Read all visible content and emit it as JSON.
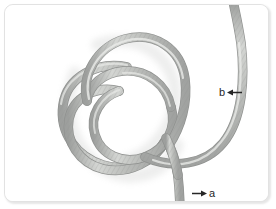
{
  "figure": {
    "kind": "photograph-diagram",
    "background_color": "#ffffff",
    "frame_border_color": "#e2e2e2",
    "rope": {
      "base_color": "#b4b6b4",
      "highlight_color": "#d9dad8",
      "shadow_color": "#9a9c9a",
      "texture": "braided",
      "thickness_px": 8
    },
    "annotations": [
      {
        "id": "a",
        "label": "a",
        "arrow_direction": "right",
        "arrow_color": "#262626",
        "position": {
          "x": 186,
          "y": 183
        },
        "points_at": "lower rope end"
      },
      {
        "id": "b",
        "label": "b",
        "arrow_direction": "left",
        "arrow_color": "#262626",
        "position": {
          "x": 214,
          "y": 82
        },
        "points_at": "right hand rope standing part"
      }
    ]
  }
}
